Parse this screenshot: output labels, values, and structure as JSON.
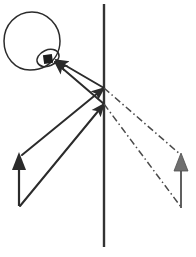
{
  "figure": {
    "width": 196,
    "height": 257,
    "background_color": "#ffffff",
    "stroke_color": "#2b2b2b",
    "virtual_stroke_color": "#4a4a4a",
    "mirror_color": "#333333",
    "virtual_image_fill": "#6f6f6f"
  },
  "observer": {
    "label": "observer-head",
    "head": {
      "cx": 32,
      "cy": 41,
      "rx": 28,
      "ry": 29,
      "stroke_color": "#2b2b2b",
      "stroke_width": 1.4,
      "fill": "none"
    },
    "eye": {
      "cx": 48,
      "cy": 58,
      "rx": 11,
      "ry": 8,
      "rotation_deg": -22,
      "stroke_color": "#2b2b2b",
      "stroke_width": 1.4,
      "fill": "none"
    },
    "pupil": {
      "cx": 48,
      "cy": 60,
      "size": 9,
      "fill": "#1e1e1e"
    }
  },
  "mirror": {
    "label": "plane-mirror",
    "x": 104,
    "y_top": 4,
    "y_bottom": 247,
    "color": "#333333",
    "width": 2.4
  },
  "object_arrow": {
    "label": "object-arrow",
    "x": 19,
    "y_base": 206,
    "y_tip": 153,
    "head_width": 13,
    "head_length": 16,
    "color": "#2b2b2b",
    "shaft_width": 2.2
  },
  "image_arrow": {
    "label": "virtual-image-arrow",
    "x": 181,
    "y_base": 207,
    "y_tip": 154,
    "head_width": 13,
    "head_length": 16,
    "color": "#6f6f6f",
    "shaft_width": 1.8
  },
  "rays": [
    {
      "name": "incident-ray-from-tip",
      "style": "solid",
      "arrowhead": "mid",
      "points": [
        [
          22,
          155
        ],
        [
          104,
          88
        ]
      ],
      "color": "#2b2b2b",
      "width": 2.0
    },
    {
      "name": "reflected-ray-to-eye-upper",
      "style": "solid",
      "arrowhead": "end",
      "points": [
        [
          104,
          88
        ],
        [
          54,
          60
        ]
      ],
      "color": "#2b2b2b",
      "width": 2.0
    },
    {
      "name": "incident-ray-from-base",
      "style": "solid",
      "arrowhead": "mid",
      "points": [
        [
          20,
          206
        ],
        [
          104,
          104
        ]
      ],
      "color": "#2b2b2b",
      "width": 2.0
    },
    {
      "name": "reflected-ray-to-eye-lower",
      "style": "solid",
      "arrowhead": "end",
      "points": [
        [
          104,
          104
        ],
        [
          54,
          62
        ]
      ],
      "color": "#2b2b2b",
      "width": 2.0
    }
  ],
  "virtual_rays": [
    {
      "name": "virtual-extension-upper",
      "style": "dash-dot",
      "points": [
        [
          104,
          88
        ],
        [
          181,
          155
        ]
      ],
      "color": "#4a4a4a",
      "width": 1.5,
      "dasharray": "7 3 1.5 3"
    },
    {
      "name": "virtual-extension-lower",
      "style": "dash-dot",
      "points": [
        [
          104,
          104
        ],
        [
          181,
          207
        ]
      ],
      "color": "#4a4a4a",
      "width": 1.5,
      "dasharray": "7 3 1.5 3"
    }
  ],
  "reflection_points": [
    {
      "name": "reflection-point-upper",
      "x": 104,
      "y": 88
    },
    {
      "name": "reflection-point-lower",
      "x": 104,
      "y": 104
    }
  ],
  "chart_data": {
    "type": "diagram",
    "xlabel": "",
    "ylabel": "",
    "elements": [
      "observer head with eye",
      "object arrow (left, upward)",
      "vertical plane mirror",
      "two incident rays",
      "two reflected rays to eye",
      "two dash-dot virtual ray extensions",
      "virtual image arrow (right, upward)"
    ]
  }
}
